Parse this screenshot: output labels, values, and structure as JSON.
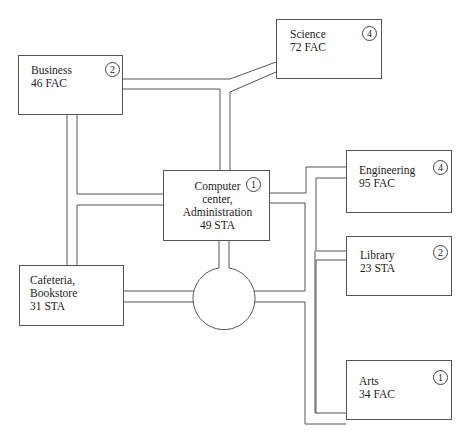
{
  "diagram": {
    "type": "campus-network-layout",
    "nodes": [
      {
        "id": "business",
        "lines": [
          "Business",
          "46 FAC"
        ],
        "badge": "2"
      },
      {
        "id": "science",
        "lines": [
          "Science",
          "72 FAC"
        ],
        "badge": "4"
      },
      {
        "id": "computer-center",
        "lines": [
          "Computer",
          "center,",
          "Administration",
          "49 STA"
        ],
        "badge": "1"
      },
      {
        "id": "engineering",
        "lines": [
          "Engineering",
          "95 FAC"
        ],
        "badge": "4"
      },
      {
        "id": "library",
        "lines": [
          "Library",
          "23 STA"
        ],
        "badge": "2"
      },
      {
        "id": "cafeteria",
        "lines": [
          "Cafeteria,",
          "Bookstore",
          "31 STA"
        ],
        "badge": ""
      },
      {
        "id": "arts",
        "lines": [
          "Arts",
          "34 FAC"
        ],
        "badge": "1"
      }
    ],
    "hub": {
      "shape": "circle",
      "label": ""
    },
    "edges": [
      [
        "business",
        "science"
      ],
      [
        "business",
        "computer-center"
      ],
      [
        "business",
        "cafeteria"
      ],
      [
        "science",
        "computer-center"
      ],
      [
        "computer-center",
        "hub"
      ],
      [
        "computer-center",
        "engineering"
      ],
      [
        "computer-center",
        "library"
      ],
      [
        "cafeteria",
        "hub"
      ],
      [
        "hub",
        "library"
      ],
      [
        "hub",
        "arts"
      ]
    ],
    "colors": {
      "line": "#555555",
      "background": "#ffffff",
      "text": "#222222"
    }
  }
}
